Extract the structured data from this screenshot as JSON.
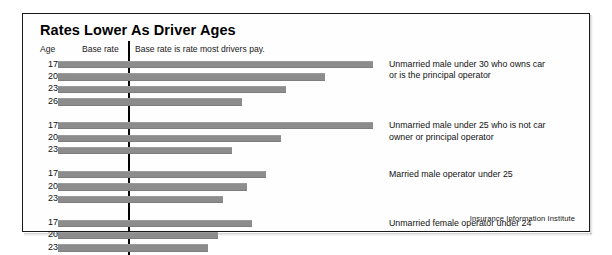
{
  "chart_data": {
    "type": "bar",
    "title": "Rates Lower As Driver Ages",
    "orientation": "horizontal",
    "xlabel": "",
    "ylabel": "Age",
    "grid": false,
    "legend_position": "right-inline",
    "annotations": {
      "base_rate_line_label": "Base rate",
      "base_rate_note": "Base rate is rate most drivers pay.",
      "age_column_header": "Age",
      "base_rate_value": 1.0
    },
    "axis_note": "Bar length is rate relative to the base rate (vertical line).",
    "groups": [
      {
        "label": "Unmarried male under 30 who owns car\nor is the principal operator",
        "categories": [
          "17",
          "20",
          "23",
          "26"
        ],
        "values": [
          6.5,
          5.5,
          4.7,
          3.8
        ]
      },
      {
        "label": "Unmarried male under 25 who is not car\nowner or principal operator",
        "categories": [
          "17",
          "20",
          "23"
        ],
        "values": [
          6.5,
          4.6,
          3.6
        ]
      },
      {
        "label": "Married male operator under 25",
        "categories": [
          "17",
          "20",
          "23"
        ],
        "values": [
          4.3,
          3.9,
          3.4
        ]
      },
      {
        "label": "Unmarried female operator under 24",
        "categories": [
          "17",
          "20",
          "23"
        ],
        "values": [
          4.0,
          3.3,
          3.1
        ]
      }
    ]
  },
  "credit": "Insurance Information Institute",
  "colors": {
    "bar": "#8c8c8c",
    "frame": "#1a1a1a",
    "text": "#111111",
    "base_line": "#000000"
  }
}
